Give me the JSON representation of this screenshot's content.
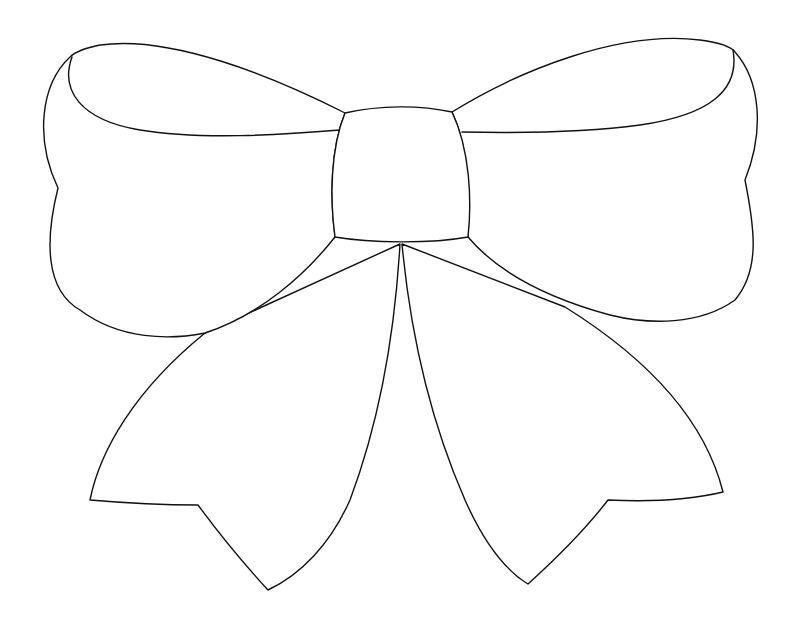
{
  "image": {
    "subject": "Bow outline drawing",
    "width": 795,
    "height": 632,
    "background": "#ffffff",
    "line_color": "#111111"
  },
  "parts": [
    {
      "id": "left-loop",
      "label": "Left loop"
    },
    {
      "id": "right-loop",
      "label": "Right loop"
    },
    {
      "id": "knot",
      "label": "Center knot"
    },
    {
      "id": "left-tail",
      "label": "Left tail"
    },
    {
      "id": "right-tail",
      "label": "Right tail"
    }
  ]
}
